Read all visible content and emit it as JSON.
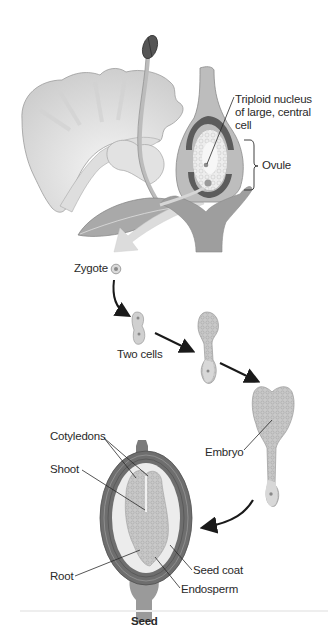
{
  "diagram": {
    "type": "biology-process-diagram",
    "topic": "Double fertilization and seed development in a flowering plant",
    "stages": [
      {
        "id": "flower",
        "label": "Flower with ovule"
      },
      {
        "id": "zygote",
        "label": "Zygote"
      },
      {
        "id": "two-cells",
        "label": "Two cells"
      },
      {
        "id": "proembryo",
        "label": ""
      },
      {
        "id": "embryo",
        "label": "Embryo"
      },
      {
        "id": "seed",
        "label": "Seed"
      }
    ],
    "labels": {
      "triploid": [
        "Triploid nucleus",
        "of large, central",
        "cell"
      ],
      "ovule": "Ovule",
      "zygote": "Zygote",
      "two_cells": "Two cells",
      "embryo": "Embryo",
      "cotyledons": "Cotyledons",
      "shoot": "Shoot",
      "root": "Root",
      "seed_coat": "Seed coat",
      "endosperm": "Endosperm",
      "seed": "Seed"
    },
    "colors": {
      "background": "#ffffff",
      "petal": "#e6e6e6",
      "petal_shade": "#c8c8c8",
      "anther": "#555555",
      "ovary_wall": "#b0b0b0",
      "ovule_dark": "#5c5c5c",
      "embryo_fill": "#c4c4c4",
      "seed_coat": "#6e6e6e",
      "endosperm": "#ececec",
      "arrow": "#1a1a1a",
      "big_arrow": "#dcdcdc",
      "text": "#2a2a2a"
    }
  }
}
